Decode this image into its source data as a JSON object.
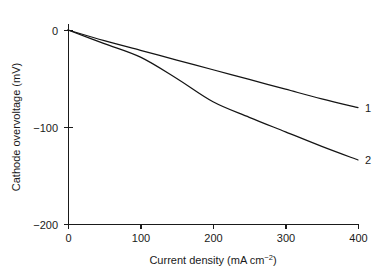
{
  "chart_data": {
    "type": "line",
    "title": "",
    "xlabel": "Current density (mA cm",
    "xlabel_exponent": "−2",
    "xlabel_tail": ")",
    "xlabel_full": "Current density (mA cm−2)",
    "ylabel": "Cathode overvoltage (mV)",
    "xlim": [
      0,
      400
    ],
    "ylim": [
      -200,
      0
    ],
    "xticks": [
      0,
      100,
      200,
      300,
      400
    ],
    "xtick_labels": [
      "0",
      "100",
      "200",
      "300",
      "400"
    ],
    "yticks": [
      0,
      -100,
      -200
    ],
    "ytick_labels": [
      "0",
      "−100",
      "−200"
    ],
    "grid": false,
    "legend": "inline-end-labels",
    "x": [
      0,
      50,
      100,
      150,
      200,
      250,
      300,
      350,
      400
    ],
    "series": [
      {
        "name": "1",
        "label": "1",
        "color": "#141414",
        "values": [
          0,
          -11,
          -21,
          -31,
          -41,
          -51,
          -61,
          -71,
          -80
        ]
      },
      {
        "name": "2",
        "label": "2",
        "color": "#141414",
        "values": [
          0,
          -14,
          -28,
          -50,
          -74,
          -90,
          -105,
          -120,
          -134
        ]
      }
    ]
  },
  "figure": {
    "background": "#ffffff",
    "axis_color": "#1a1a1a",
    "plot_left_px": 68,
    "plot_right_px": 358,
    "plot_top_px": 30,
    "plot_bottom_px": 224
  }
}
